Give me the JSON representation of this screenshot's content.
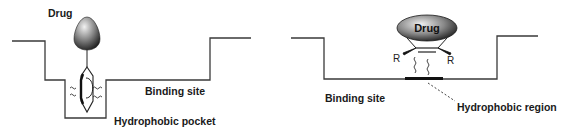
{
  "left_panel": {
    "drug_label": "Drug",
    "binding_site_label": "Binding site",
    "pocket_label": "Hydrophobic pocket"
  },
  "right_panel": {
    "drug_label": "Drug",
    "substituent_left": "R",
    "substituent_right": "R",
    "binding_site_label": "Binding site",
    "region_label": "Hydrophobic region"
  },
  "colors": {
    "line": "#3a3a3a",
    "drug_dark": "#2a2a2a",
    "drug_light": "#e0e0e0"
  }
}
